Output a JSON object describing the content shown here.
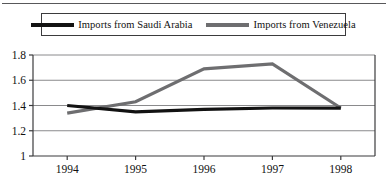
{
  "chart_data": {
    "type": "line",
    "title": "",
    "subtitle": "",
    "xlabel": "",
    "ylabel": "",
    "categories": [
      "1994",
      "1995",
      "1996",
      "1997",
      "1998"
    ],
    "x": [
      1994,
      1995,
      1996,
      1997,
      1998
    ],
    "series": [
      {
        "name": "Imports from Saudi Arabia",
        "color": "#121212",
        "values": [
          1.4,
          1.35,
          1.37,
          1.38,
          1.38
        ]
      },
      {
        "name": "Imports from Venezuela",
        "color": "#6e6e70",
        "values": [
          1.34,
          1.43,
          1.69,
          1.73,
          1.38
        ]
      }
    ],
    "ylim": [
      1.0,
      1.8
    ],
    "xlim": [
      1993.5,
      1998.5
    ],
    "yticks": [
      "1",
      "1.2",
      "1.4",
      "1.6",
      "1.8"
    ],
    "ytick_values": [
      1.0,
      1.2,
      1.4,
      1.6,
      1.8
    ],
    "xticks": [
      "1994",
      "1995",
      "1996",
      "1997",
      "1998"
    ],
    "grid": true,
    "grid_axis": "y",
    "legend_position": "top",
    "legend": [
      "Imports from Saudi Arabia",
      "Imports from Venezuela"
    ]
  },
  "legend": {
    "entries": [
      {
        "label": "Imports from Saudi Arabia",
        "swatch": "saudi-line-swatch"
      },
      {
        "label": "Imports from Venezuela",
        "swatch": "venezuela-line-swatch"
      }
    ]
  },
  "axes": {
    "y_labels": [
      "1.8",
      "1.6",
      "1.4",
      "1.2",
      "1"
    ],
    "x_labels": [
      "1994",
      "1995",
      "1996",
      "1997",
      "1998"
    ]
  },
  "colors": {
    "saudi": "#121212",
    "venezuela": "#6e6e70",
    "grid": "#8a8a8c",
    "axis": "#3b3b3d",
    "rule": "#58585a"
  }
}
